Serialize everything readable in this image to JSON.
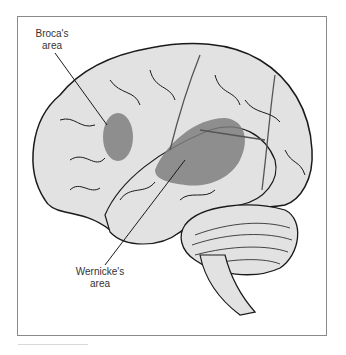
{
  "diagram": {
    "labels": {
      "broca": [
        "Broca's",
        "area"
      ],
      "wernicke": [
        "Wernicke's",
        "area"
      ]
    },
    "colors": {
      "brain_fill": "#e2e2e2",
      "outline": "#1a1a1a",
      "highlight": "#7f7f7f",
      "background": "#ffffff",
      "frame": "#8a8a8a"
    }
  }
}
